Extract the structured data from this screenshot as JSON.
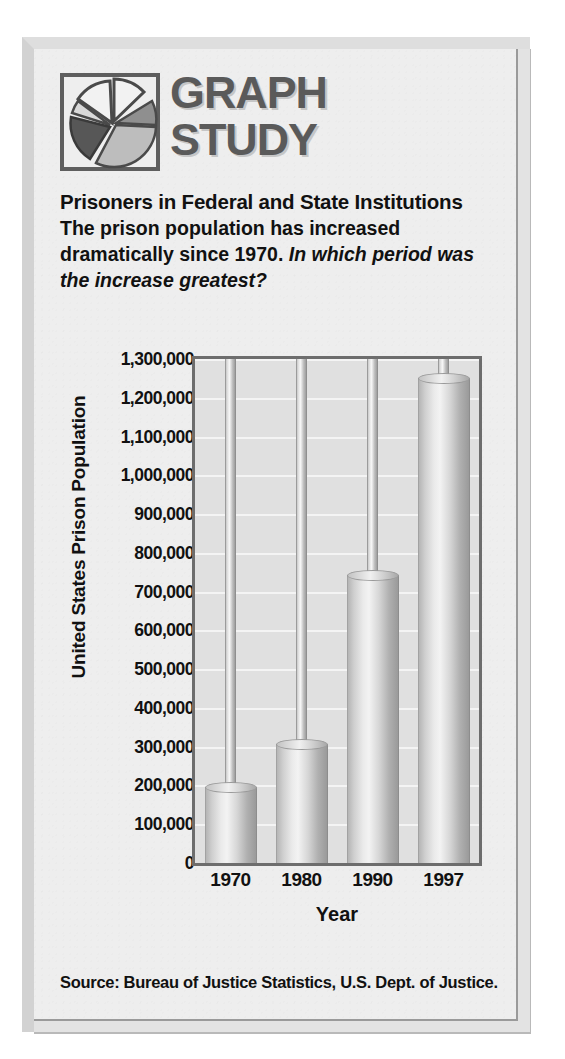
{
  "logo": {
    "line1": "GRAPH",
    "line2": "STUDY",
    "icon": "pie-chart-icon",
    "frame_color": "#5e5e5e",
    "text_color": "#5a5a5a"
  },
  "headline": {
    "title": "Prisoners in Federal and State Institutions",
    "body": "The prison population has increased dramatically since 1970.",
    "question": "In which period was the increase greatest?"
  },
  "source": "Source: Bureau of Justice Statistics, U.S. Dept. of Justice.",
  "chart_data": {
    "type": "bar",
    "title": "Prisoners in Federal and State Institutions",
    "xlabel": "Year",
    "ylabel": "United States Prison Population",
    "categories": [
      "1970",
      "1980",
      "1990",
      "1997"
    ],
    "values": [
      196000,
      308000,
      744000,
      1250000
    ],
    "ylim": [
      0,
      1300000
    ],
    "ytick_step": 100000,
    "ytick_labels": [
      "1,300,000",
      "1,200,000",
      "1,100,000",
      "1,000,000",
      "900,000",
      "800,000",
      "700,000",
      "600,000",
      "500,000",
      "400,000",
      "300,000",
      "200,000",
      "100,000",
      "0"
    ],
    "ytick_values": [
      1300000,
      1200000,
      1100000,
      1000000,
      900000,
      800000,
      700000,
      600000,
      500000,
      400000,
      300000,
      200000,
      100000,
      0
    ],
    "grid": true,
    "legend": "none",
    "plot_bg": "#e0e0e0",
    "gridline_color": "#f4f4f4",
    "frame_color": "#6d6d6d",
    "bar_style": "3d-cylinder"
  }
}
